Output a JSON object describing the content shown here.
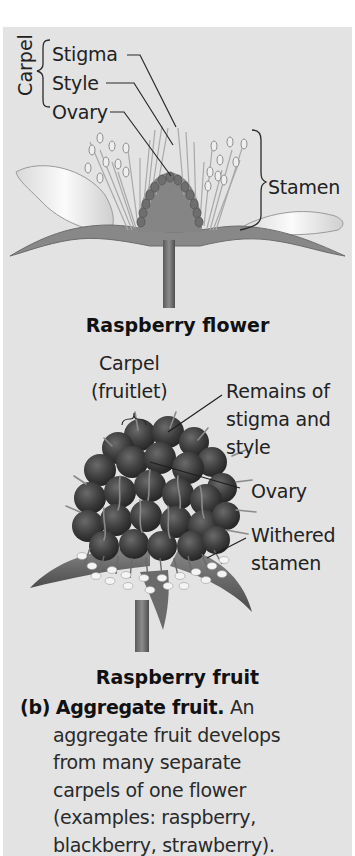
{
  "flower": {
    "group_label": "Carpel",
    "labels": {
      "stigma": "Stigma",
      "style": "Style",
      "ovary": "Ovary",
      "stamen": "Stamen"
    },
    "title": "Raspberry flower"
  },
  "fruit": {
    "labels": {
      "carpel_line1": "Carpel",
      "carpel_line2": "(fruitlet)",
      "remains_line1": "Remains of",
      "remains_line2": "stigma and",
      "remains_line3": "style",
      "ovary": "Ovary",
      "withered_line1": "Withered",
      "withered_line2": "stamen"
    },
    "title": "Raspberry fruit"
  },
  "caption": {
    "tag": "(b)",
    "heading": "Aggregate fruit.",
    "first_line_rest": " An",
    "lines": [
      "aggregate fruit develops",
      "from many separate",
      "carpels of one flower",
      "(examples: raspberry,",
      "blackberry, strawberry)."
    ]
  },
  "colors": {
    "panel_bg": "#e3e3e3",
    "text": "#222222",
    "fruit_dark": "#3a3a3a",
    "flower_tissue": "#7b7b7b"
  }
}
